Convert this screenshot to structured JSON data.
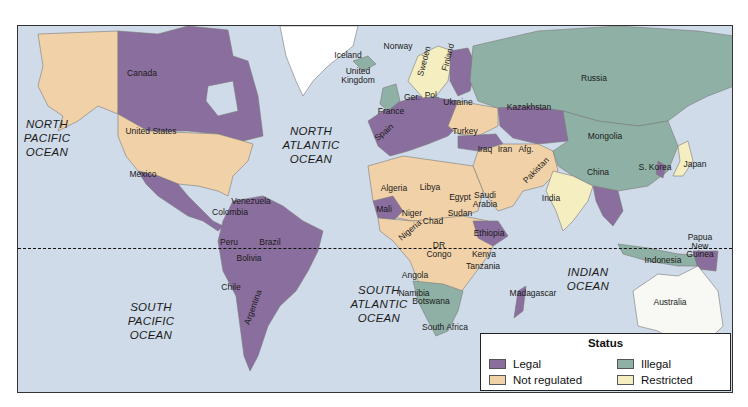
{
  "colors": {
    "ocean": "#cfdbe8",
    "legal": "#8a6e9e",
    "illegal": "#8fb0a4",
    "not_regulated": "#f1d2a8",
    "restricted": "#f4eec0",
    "no_data": "#ffffff",
    "border": "#7a7a7a"
  },
  "legend": {
    "title": "Status",
    "items": [
      {
        "label": "Legal",
        "color": "#8a6e9e"
      },
      {
        "label": "Illegal",
        "color": "#8fb0a4"
      },
      {
        "label": "Not regulated",
        "color": "#f1d2a8"
      },
      {
        "label": "Restricted",
        "color": "#f4eec0"
      }
    ]
  },
  "oceans": [
    {
      "name": "NORTH\nPACIFIC\nOCEAN",
      "x": 32,
      "y": 117
    },
    {
      "name": "NORTH\nATLANTIC\nOCEAN",
      "x": 296,
      "y": 124
    },
    {
      "name": "SOUTH\nPACIFIC\nOCEAN",
      "x": 136,
      "y": 300
    },
    {
      "name": "SOUTH\nATLANTIC\nOCEAN",
      "x": 364,
      "y": 283
    },
    {
      "name": "INDIAN\nOCEAN",
      "x": 573,
      "y": 265
    }
  ],
  "countries": [
    {
      "name": "Canada",
      "x": 141,
      "y": 72
    },
    {
      "name": "United States",
      "x": 150,
      "y": 130
    },
    {
      "name": "Mexico",
      "x": 142,
      "y": 173
    },
    {
      "name": "Venezuela",
      "x": 250,
      "y": 200
    },
    {
      "name": "Colombia",
      "x": 229,
      "y": 211
    },
    {
      "name": "Brazil",
      "x": 269,
      "y": 241
    },
    {
      "name": "Peru",
      "x": 228,
      "y": 241
    },
    {
      "name": "Bolivia",
      "x": 248,
      "y": 257
    },
    {
      "name": "Chile",
      "x": 230,
      "y": 286
    },
    {
      "name": "Argentina",
      "x": 252,
      "y": 306,
      "rotate": -70
    },
    {
      "name": "Iceland",
      "x": 347,
      "y": 54
    },
    {
      "name": "Norway",
      "x": 397,
      "y": 45
    },
    {
      "name": "Sweden",
      "x": 423,
      "y": 60,
      "rotate": -75
    },
    {
      "name": "Finland",
      "x": 447,
      "y": 56,
      "rotate": -75
    },
    {
      "name": "United\nKingdom",
      "x": 357,
      "y": 70
    },
    {
      "name": "Russia",
      "x": 593,
      "y": 77
    },
    {
      "name": "France",
      "x": 390,
      "y": 110
    },
    {
      "name": "Ger.",
      "x": 411,
      "y": 96
    },
    {
      "name": "Pol.",
      "x": 431,
      "y": 94
    },
    {
      "name": "Ukraine",
      "x": 457,
      "y": 101
    },
    {
      "name": "Spain",
      "x": 383,
      "y": 131,
      "rotate": -40
    },
    {
      "name": "Turkey",
      "x": 464,
      "y": 130
    },
    {
      "name": "Kazakhstan",
      "x": 528,
      "y": 106
    },
    {
      "name": "Mongolia",
      "x": 604,
      "y": 135
    },
    {
      "name": "China",
      "x": 597,
      "y": 171
    },
    {
      "name": "S. Korea",
      "x": 654,
      "y": 166
    },
    {
      "name": "Japan",
      "x": 694,
      "y": 163
    },
    {
      "name": "Iraq",
      "x": 484,
      "y": 148
    },
    {
      "name": "Iran",
      "x": 504,
      "y": 148
    },
    {
      "name": "Afg.",
      "x": 525,
      "y": 148
    },
    {
      "name": "Pakistan",
      "x": 535,
      "y": 169,
      "rotate": -45
    },
    {
      "name": "India",
      "x": 550,
      "y": 197
    },
    {
      "name": "Algeria",
      "x": 393,
      "y": 187
    },
    {
      "name": "Libya",
      "x": 429,
      "y": 186
    },
    {
      "name": "Egypt",
      "x": 459,
      "y": 196
    },
    {
      "name": "Saudi\nArabia",
      "x": 484,
      "y": 194
    },
    {
      "name": "Mali",
      "x": 383,
      "y": 208
    },
    {
      "name": "Niger",
      "x": 411,
      "y": 212
    },
    {
      "name": "Chad",
      "x": 432,
      "y": 220
    },
    {
      "name": "Nigeria",
      "x": 409,
      "y": 229,
      "rotate": -40
    },
    {
      "name": "Sudan",
      "x": 459,
      "y": 212
    },
    {
      "name": "Ethiopia",
      "x": 488,
      "y": 232
    },
    {
      "name": "DR\nCongo",
      "x": 438,
      "y": 244
    },
    {
      "name": "Kenya",
      "x": 483,
      "y": 253
    },
    {
      "name": "Tanzania",
      "x": 482,
      "y": 265
    },
    {
      "name": "Angola",
      "x": 414,
      "y": 274
    },
    {
      "name": "Namibia",
      "x": 413,
      "y": 292
    },
    {
      "name": "Botswana",
      "x": 430,
      "y": 300
    },
    {
      "name": "South Africa",
      "x": 444,
      "y": 326
    },
    {
      "name": "Madagascar",
      "x": 532,
      "y": 292
    },
    {
      "name": "Indonesia",
      "x": 662,
      "y": 259
    },
    {
      "name": "Papua\nNew\nGuinea",
      "x": 699,
      "y": 236
    },
    {
      "name": "Australia",
      "x": 669,
      "y": 301
    }
  ]
}
